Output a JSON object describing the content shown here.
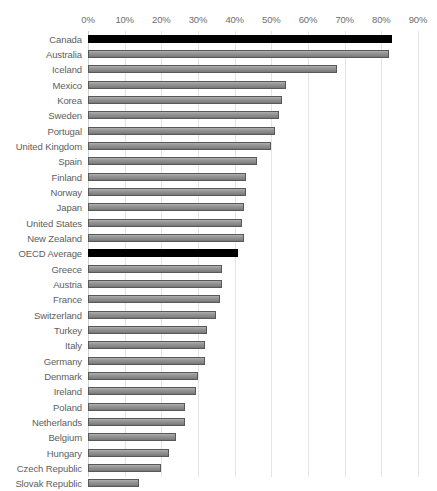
{
  "chart_data": {
    "type": "bar",
    "orientation": "horizontal",
    "title": "",
    "xlabel": "",
    "ylabel": "",
    "xlim": [
      0,
      90
    ],
    "xticks": [
      0,
      10,
      20,
      30,
      40,
      50,
      60,
      70,
      80,
      90
    ],
    "xtick_labels": [
      "0%",
      "10%",
      "20%",
      "30%",
      "40%",
      "50%",
      "60%",
      "70%",
      "80%",
      "90%"
    ],
    "grid": true,
    "legend": "none",
    "value_suffix": "%",
    "bar_color": "#8f8f8f",
    "bar_border_color": "#585858",
    "highlight_color": "#000000",
    "highlighted_categories": [
      "Canada",
      "OECD Average"
    ],
    "categories": [
      "Canada",
      "Australia",
      "Iceland",
      "Mexico",
      "Korea",
      "Sweden",
      "Portugal",
      "United Kingdom",
      "Spain",
      "Finland",
      "Norway",
      "Japan",
      "United States",
      "New Zealand",
      "OECD Average",
      "Greece",
      "Austria",
      "France",
      "Switzerland",
      "Turkey",
      "Italy",
      "Germany",
      "Denmark",
      "Ireland",
      "Poland",
      "Netherlands",
      "Belgium",
      "Hungary",
      "Czech Republic",
      "Slovak Republic"
    ],
    "values": [
      83,
      82,
      68,
      54,
      53,
      52,
      51,
      50,
      46,
      43,
      43,
      42.5,
      42,
      42.5,
      41,
      36.5,
      36.5,
      36,
      35,
      32.5,
      32,
      32,
      30,
      29.5,
      26.5,
      26.5,
      24,
      22,
      20,
      14
    ],
    "bars": [
      {
        "label": "Canada",
        "value": 83,
        "highlight": true
      },
      {
        "label": "Australia",
        "value": 82,
        "highlight": false
      },
      {
        "label": "Iceland",
        "value": 68,
        "highlight": false
      },
      {
        "label": "Mexico",
        "value": 54,
        "highlight": false
      },
      {
        "label": "Korea",
        "value": 53,
        "highlight": false
      },
      {
        "label": "Sweden",
        "value": 52,
        "highlight": false
      },
      {
        "label": "Portugal",
        "value": 51,
        "highlight": false
      },
      {
        "label": "United Kingdom",
        "value": 50,
        "highlight": false
      },
      {
        "label": "Spain",
        "value": 46,
        "highlight": false
      },
      {
        "label": "Finland",
        "value": 43,
        "highlight": false
      },
      {
        "label": "Norway",
        "value": 43,
        "highlight": false
      },
      {
        "label": "Japan",
        "value": 42.5,
        "highlight": false
      },
      {
        "label": "United States",
        "value": 42,
        "highlight": false
      },
      {
        "label": "New Zealand",
        "value": 42.5,
        "highlight": false
      },
      {
        "label": "OECD Average",
        "value": 41,
        "highlight": true
      },
      {
        "label": "Greece",
        "value": 36.5,
        "highlight": false
      },
      {
        "label": "Austria",
        "value": 36.5,
        "highlight": false
      },
      {
        "label": "France",
        "value": 36,
        "highlight": false
      },
      {
        "label": "Switzerland",
        "value": 35,
        "highlight": false
      },
      {
        "label": "Turkey",
        "value": 32.5,
        "highlight": false
      },
      {
        "label": "Italy",
        "value": 32,
        "highlight": false
      },
      {
        "label": "Germany",
        "value": 32,
        "highlight": false
      },
      {
        "label": "Denmark",
        "value": 30,
        "highlight": false
      },
      {
        "label": "Ireland",
        "value": 29.5,
        "highlight": false
      },
      {
        "label": "Poland",
        "value": 26.5,
        "highlight": false
      },
      {
        "label": "Netherlands",
        "value": 26.5,
        "highlight": false
      },
      {
        "label": "Belgium",
        "value": 24,
        "highlight": false
      },
      {
        "label": "Hungary",
        "value": 22,
        "highlight": false
      },
      {
        "label": "Czech Republic",
        "value": 20,
        "highlight": false
      },
      {
        "label": "Slovak Republic",
        "value": 14,
        "highlight": false
      }
    ]
  }
}
